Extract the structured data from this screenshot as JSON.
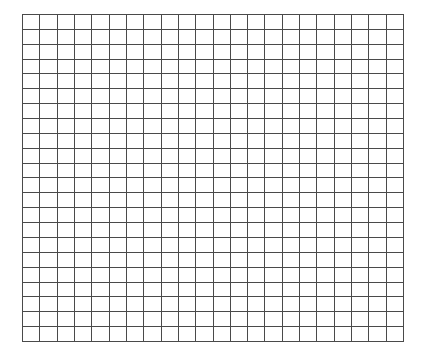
{
  "grid": {
    "rows": 22,
    "columns": 22,
    "line_color": "#4a4a4a",
    "background_color": "#ffffff"
  }
}
